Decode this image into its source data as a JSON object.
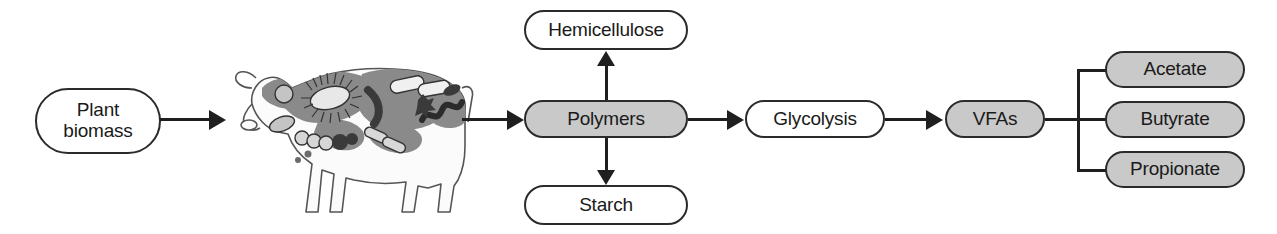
{
  "diagram": {
    "colors": {
      "node_fill_gray": "#c9c9c9",
      "node_fill_white": "#ffffff",
      "node_stroke": "#2b2b2b",
      "edge": "#1f1f1f",
      "cow_patch_gray": "#8a8a8a",
      "cow_body_white": "#fbfbfb",
      "microbe_dark": "#3a3a3a"
    },
    "nodes": [
      {
        "id": "plant-biomass",
        "label": "Plant\nbiomass",
        "line1": "Plant",
        "line2": "biomass",
        "fill": "white"
      },
      {
        "id": "hemicellulose",
        "label": "Hemicellulose",
        "fill": "white"
      },
      {
        "id": "polymers",
        "label": "Polymers",
        "fill": "gray"
      },
      {
        "id": "starch",
        "label": "Starch",
        "fill": "white"
      },
      {
        "id": "glycolysis",
        "label": "Glycolysis",
        "fill": "white"
      },
      {
        "id": "vfas",
        "label": "VFAs",
        "fill": "gray"
      },
      {
        "id": "acetate",
        "label": "Acetate",
        "fill": "gray"
      },
      {
        "id": "butyrate",
        "label": "Butyrate",
        "fill": "gray"
      },
      {
        "id": "propionate",
        "label": "Propionate",
        "fill": "gray"
      }
    ],
    "edges": [
      {
        "from": "plant-biomass",
        "to": "cow",
        "type": "arrow-right"
      },
      {
        "from": "cow",
        "to": "polymers",
        "type": "arrow-right"
      },
      {
        "from": "polymers",
        "to": "hemicellulose",
        "type": "arrow-up"
      },
      {
        "from": "polymers",
        "to": "starch",
        "type": "arrow-down"
      },
      {
        "from": "polymers",
        "to": "glycolysis",
        "type": "arrow-right"
      },
      {
        "from": "glycolysis",
        "to": "vfas",
        "type": "arrow-right"
      },
      {
        "from": "vfas",
        "to": "acetate",
        "type": "bracket-line"
      },
      {
        "from": "vfas",
        "to": "butyrate",
        "type": "bracket-line"
      },
      {
        "from": "vfas",
        "to": "propionate",
        "type": "bracket-line"
      }
    ],
    "illustration": {
      "name": "cow-with-rumen-microbes",
      "caption": "Cow with gray coat patches containing drawings of rumen microbes"
    }
  }
}
